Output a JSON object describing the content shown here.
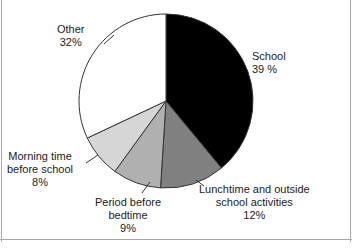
{
  "chart_data": {
    "type": "pie",
    "title": "",
    "subtitle": "",
    "xlabel": "",
    "ylabel": "",
    "legend_position": "none",
    "grid": false,
    "total_percent": 100,
    "start_angle_deg": 0,
    "direction": "clockwise",
    "categories": [
      "School",
      "Lunchtime and outside school activities",
      "Period before bedtime",
      "Morning time before school",
      "Other"
    ],
    "values": [
      39,
      12,
      9,
      8,
      32
    ],
    "slices": [
      {
        "name": "School",
        "label_line1": "School",
        "label_line2": "39 %",
        "value": 39,
        "color": "#000000",
        "start_deg": 0,
        "end_deg": 140.4,
        "leader": false
      },
      {
        "name": "Lunchtime and outside school activities",
        "label_line1": "Lunchtime and outside",
        "label_line2": "school activities",
        "label_line3": "12%",
        "value": 12,
        "color": "#808080",
        "start_deg": 140.4,
        "end_deg": 183.6,
        "leader": true
      },
      {
        "name": "Period before bedtime",
        "label_line1": "Period before",
        "label_line2": "bedtime",
        "label_line3": "9%",
        "value": 9,
        "color": "#b0b0b0",
        "start_deg": 183.6,
        "end_deg": 216.0,
        "leader": true
      },
      {
        "name": "Morning time before school",
        "label_line1": "Morning time",
        "label_line2": "before school",
        "label_line3": "8%",
        "value": 8,
        "color": "#d6d6d6",
        "start_deg": 216.0,
        "end_deg": 244.8,
        "leader": true
      },
      {
        "name": "Other",
        "label_line1": "Other",
        "label_line2": "32%",
        "value": 32,
        "color": "#ffffff",
        "start_deg": 244.8,
        "end_deg": 360.0,
        "leader": true
      }
    ],
    "geometry": {
      "center_x": 166,
      "center_y": 101,
      "radius": 87
    },
    "style": {
      "outline_color": "#333333",
      "frame_color": "#a8a8a8",
      "background": "#ffffff",
      "text_color": "#1a1a1a"
    }
  }
}
